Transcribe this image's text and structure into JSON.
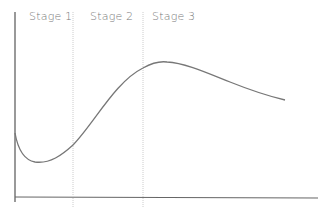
{
  "diagram": {
    "type": "stage-curve",
    "stages": [
      {
        "label": "Stage 1",
        "x": 22
      },
      {
        "label": "Stage 2",
        "x": 90
      },
      {
        "label": "Stage 3",
        "x": 152
      }
    ],
    "dividers_x": [
      73,
      143
    ],
    "axes": {
      "y_axis_x": 15,
      "x_axis_y": 197
    },
    "curve_path": "M15,133 C18,150 24,160 35,162 C50,164 62,155 73,145 C95,122 115,82 143,68 C152,63 160,61 167,62 C185,63 205,72 230,82 C250,90 268,96 285,100",
    "colors": {
      "axis": "#666666",
      "curve": "#777777",
      "divider": "#cccccc",
      "text": "#777777"
    }
  }
}
